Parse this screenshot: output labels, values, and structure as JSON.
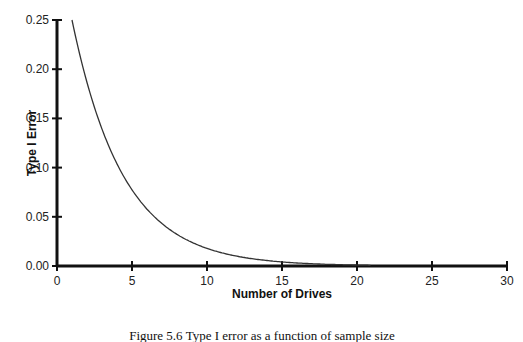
{
  "chart_data": {
    "type": "line",
    "title": "",
    "xlabel": "Number of Drives",
    "ylabel": "Type I Error",
    "xlim": [
      0,
      30
    ],
    "ylim": [
      0,
      0.25
    ],
    "x_ticks": [
      "0",
      "5",
      "10",
      "15",
      "20",
      "25",
      "30"
    ],
    "y_ticks": [
      "0.00",
      "0.05",
      "0.10",
      "0.15",
      "0.20",
      "0.25"
    ],
    "grid": false,
    "legend": null,
    "series": [
      {
        "name": "Type I Error",
        "x": [
          1,
          2,
          3,
          4,
          5,
          6,
          7,
          8,
          9,
          10,
          12,
          14,
          16,
          18,
          20,
          21
        ],
        "values": [
          0.25,
          0.186,
          0.139,
          0.104,
          0.077,
          0.058,
          0.043,
          0.032,
          0.024,
          0.018,
          0.01,
          0.006,
          0.003,
          0.002,
          0.001,
          0.0007
        ]
      }
    ]
  },
  "caption": "Figure 5.6 Type I error as a function of sample size"
}
